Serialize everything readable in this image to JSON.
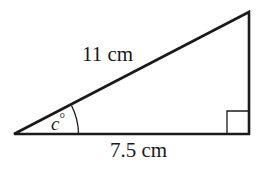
{
  "diagram": {
    "type": "right-triangle",
    "hypotenuse_label": "11 cm",
    "base_label": "7.5 cm",
    "angle_label_var": "c",
    "angle_label_unit": "°",
    "right_angle_marker": true,
    "stroke_color": "#1a1a1a",
    "background": "#ffffff"
  }
}
